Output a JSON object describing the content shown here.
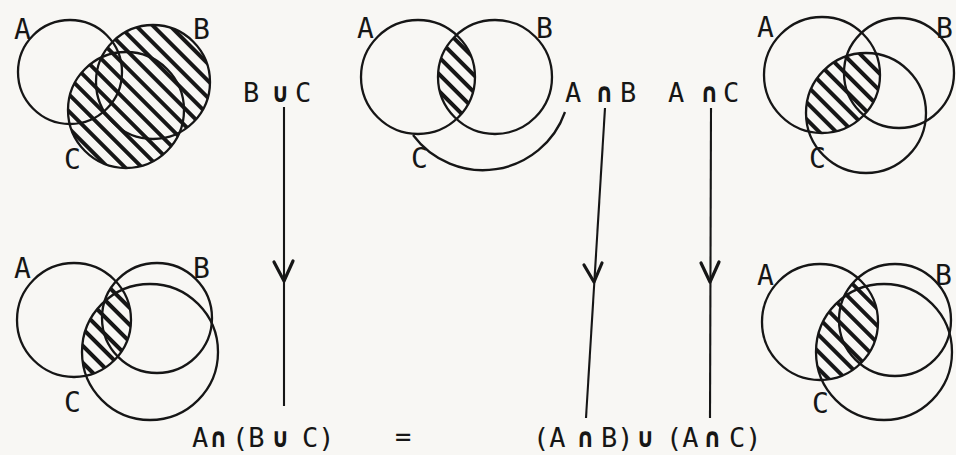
{
  "colors": {
    "ink": "#161616",
    "paper": "#f8f7f4"
  },
  "diagrams": [
    {
      "position": "top-left",
      "shaded_region": "B ∪ C",
      "labels": {
        "A": "A",
        "B": "B",
        "C": "C"
      }
    },
    {
      "position": "top-middle",
      "shaded_region": "A ∩ B",
      "labels": {
        "A": "A",
        "B": "B",
        "C": "C"
      }
    },
    {
      "position": "top-right",
      "shaded_region": "A ∩ C",
      "labels": {
        "A": "A",
        "B": "B",
        "C": "C"
      }
    },
    {
      "position": "bottom-left",
      "shaded_region": "A ∩ (B ∪ C)",
      "labels": {
        "A": "A",
        "B": "B",
        "C": "C"
      }
    },
    {
      "position": "bottom-right",
      "shaded_region": "(A ∩ B) ∪ (A ∩ C)",
      "labels": {
        "A": "A",
        "B": "B",
        "C": "C"
      }
    }
  ],
  "annotations": {
    "b_union_c": [
      "B",
      "∪",
      "C"
    ],
    "a_intersect_b": [
      "A",
      "∩",
      "B"
    ],
    "a_intersect_c": [
      "A",
      "∩",
      "C"
    ]
  },
  "equation": {
    "left": [
      "A",
      "∩",
      "(B",
      "∪",
      "C)"
    ],
    "equals": "=",
    "right": [
      "(A",
      "∩",
      "B)",
      "∪",
      "(A",
      "∩",
      "C)"
    ]
  }
}
